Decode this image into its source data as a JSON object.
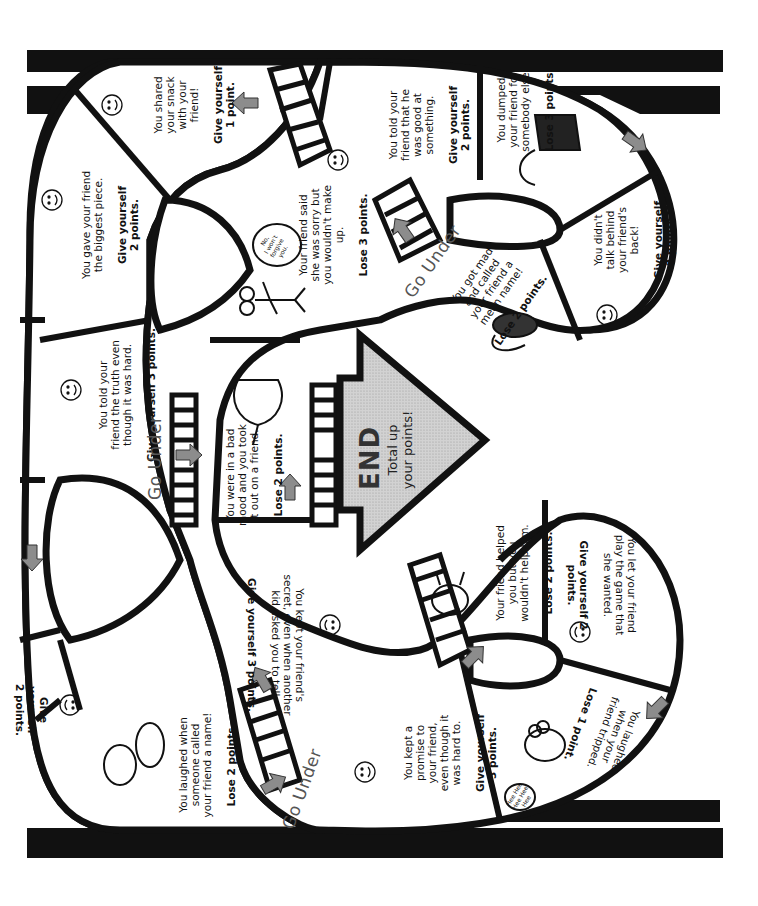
{
  "board": {
    "title": "Friendship board game",
    "orientation": "rotated 90 degrees",
    "colors": {
      "track_outline": "#111111",
      "arrow": "#8a8a8a",
      "end_fill": "#cfcfcf",
      "background": "#ffffff"
    },
    "end": {
      "title": "END",
      "subtitle": "Total up\nyour points!"
    },
    "go_under_label": "Go Under",
    "spaces": [
      {
        "id": "shared-snack",
        "message": "You shared\nyour snack\nwith your\nfriend!",
        "points": "Give yourself\n1 point.",
        "icon": "smiley-icon"
      },
      {
        "id": "biggest-piece",
        "message": "You gave your friend\nthe biggest piece.",
        "points": "Give yourself\n2 points.",
        "icon": "smiley-icon"
      },
      {
        "id": "told-truth",
        "message": "You told your\nfriend the truth even\nthough it was hard.",
        "points": "Give yourself 3 points.",
        "icon": "smiley-icon"
      },
      {
        "id": "kept-secret",
        "message": "You kept your friend's\nsecret, even when another\nkid asked you to tell.",
        "points": "Give yourself 3 points.",
        "icon": "smiley-icon"
      },
      {
        "id": "laughed-name",
        "message": "You laughed when\nsomeone called\nyour friend a name!",
        "points": "Lose 2 points.",
        "icon": "kids-laughing-illustration"
      },
      {
        "id": "left-edge-give",
        "message": "",
        "points": "Give yourself\n2 points.",
        "icon": "smiley-icon"
      },
      {
        "id": "wouldnt-make-up",
        "message": "Your friend said\nshe was sorry but\nyou wouldn't make\nup.",
        "points": "Lose 3 points.",
        "icon": "stick-figure-illustration",
        "bubble": "No,\nI won't\nforgive\nyou."
      },
      {
        "id": "bad-mood",
        "message": "You were in a bad\nmood and you took\nit out on a friend.",
        "points": "Lose 2 points.",
        "icon": "angry-rat-illustration"
      },
      {
        "id": "good-at-something",
        "message": "You told your\nfriend that he\nwas good at\nsomething.",
        "points": "Give yourself\n2 points.",
        "icon": "smiley-icon"
      },
      {
        "id": "dumped-friend",
        "message": "You dumped\nyour friend for\nsomebody else!",
        "points": "Lose 3 points.",
        "icon": "cat-skunk-illustration"
      },
      {
        "id": "mean-name",
        "message": "You got mad\nand called\nyour friend a\nmean name!",
        "points": "Lose 2 points.",
        "icon": "angry-hedgehog-illustration"
      },
      {
        "id": "didnt-talk-behind",
        "message": "You didn't\ntalk behind\nyour friend's\nback!",
        "points": "Give yourself\n2 points.",
        "icon": "smiley-icon"
      },
      {
        "id": "wouldnt-help",
        "message": "Your friend helped\nyou but you\nwouldn't help him.",
        "points": "Lose 2 points.",
        "icon": "grumpy-creature-illustration"
      },
      {
        "id": "let-play-game",
        "message": "You let your friend\nplay the game that\nshe wanted.",
        "points": "Give yourself 2\npoints.",
        "icon": "smiley-icon"
      },
      {
        "id": "kept-promise",
        "message": "You kept a\npromise to\nyour friend,\neven though it\nwas hard to.",
        "points": "Give yourself\n3 points.",
        "icon": "smiley-icon"
      },
      {
        "id": "laughed-tripped",
        "message": "You laughed\nwhen your\nfriend tripped.",
        "points": "Lose 1 point.",
        "icon": "laughing-monster-illustration",
        "bubble": "Hee Hee\nHee Hee\nHee"
      }
    ]
  }
}
